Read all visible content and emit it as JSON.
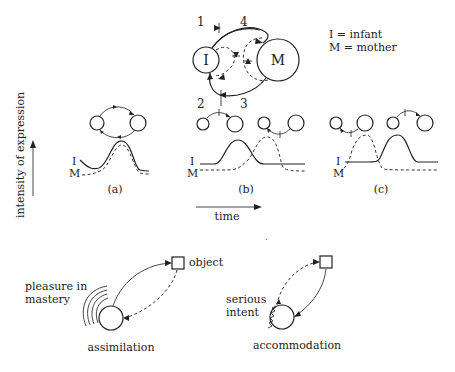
{
  "legend": {
    "infant": "I = infant",
    "mother": "M = mother"
  },
  "main_diagram": {
    "infant_label": "I",
    "mother_label": "M",
    "arc_numbers": [
      "1",
      "4",
      "2",
      "3"
    ]
  },
  "curves": {
    "y_axis_label": "intensity of expression",
    "x_axis_label": "time",
    "series_labels": {
      "infant": "I",
      "mother": "M"
    },
    "panels": [
      {
        "id": "a",
        "caption": "(a)"
      },
      {
        "id": "b",
        "caption": "(b)"
      },
      {
        "id": "c",
        "caption": "(c)"
      }
    ]
  },
  "assimilation": {
    "caption": "assimilation",
    "annotation": "pleasure in mastery",
    "annotation_lines": [
      "pleasure in",
      "mastery"
    ],
    "object_label": "object"
  },
  "accommodation": {
    "caption": "accommodation",
    "annotation_lines": [
      "serious",
      "intent"
    ]
  },
  "stray_mark": "."
}
